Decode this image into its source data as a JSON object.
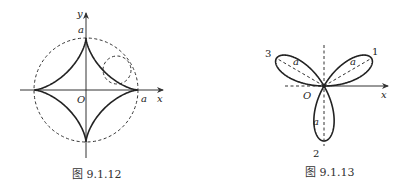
{
  "figures": [
    {
      "caption": "图 9.1.12",
      "curve": "astroid",
      "labels": {
        "y_axis": "y",
        "x_axis": "x",
        "origin": "O",
        "top": "a",
        "right": "a"
      }
    },
    {
      "caption": "图 9.1.13",
      "curve": "three-leaved rose",
      "labels": {
        "x_axis": "x",
        "origin": "O",
        "petal_1": "1",
        "petal_2": "2",
        "petal_3": "3",
        "petal_length": "a"
      },
      "petal_angles_deg": [
        30,
        270,
        150
      ]
    }
  ]
}
